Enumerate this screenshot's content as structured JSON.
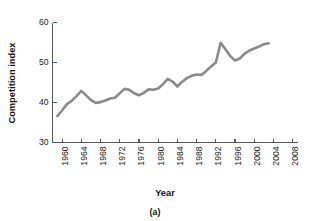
{
  "figure": {
    "caption": "(a)",
    "background": "#ffffff"
  },
  "chart_data": {
    "type": "line",
    "title": "",
    "xlabel": "Year",
    "ylabel": "Competition index",
    "xlim": [
      1958,
      2009
    ],
    "ylim": [
      30,
      60
    ],
    "xticks": [
      1960,
      1964,
      1968,
      1972,
      1976,
      1980,
      1984,
      1988,
      1992,
      1996,
      2000,
      2004,
      2008
    ],
    "yticks": [
      30,
      40,
      50,
      60
    ],
    "grid": false,
    "legend": null,
    "line_color": "#8a8a8a",
    "line_width": 2.6,
    "series": [
      {
        "name": "Competition index",
        "x": [
          1959,
          1960,
          1961,
          1962,
          1963,
          1964,
          1965,
          1966,
          1967,
          1968,
          1969,
          1970,
          1971,
          1972,
          1973,
          1974,
          1975,
          1976,
          1977,
          1978,
          1979,
          1980,
          1981,
          1982,
          1983,
          1984,
          1985,
          1986,
          1987,
          1988,
          1989,
          1990,
          1991,
          1992,
          1993,
          1994,
          1995,
          1996,
          1997,
          1998,
          1999,
          2000,
          2001,
          2002,
          2003
        ],
        "values": [
          36.6,
          38.0,
          39.6,
          40.4,
          41.6,
          42.9,
          41.8,
          40.6,
          39.9,
          40.1,
          40.5,
          41.0,
          41.2,
          42.3,
          43.4,
          43.2,
          42.3,
          41.8,
          42.4,
          43.3,
          43.2,
          43.5,
          44.6,
          45.9,
          45.2,
          44.0,
          45.2,
          46.1,
          46.7,
          47.0,
          46.9,
          47.9,
          49.0,
          50.0,
          54.9,
          53.3,
          51.6,
          50.5,
          51.0,
          52.2,
          53.0,
          53.5,
          54.0,
          54.6,
          54.8
        ]
      }
    ]
  },
  "axis_labels": {
    "ytick_texts": [
      "30",
      "40",
      "50",
      "60"
    ],
    "xtick_texts": [
      "1960",
      "1964",
      "1968",
      "1972",
      "1976",
      "1980",
      "1984",
      "1988",
      "1992",
      "1996",
      "2000",
      "2004",
      "2008"
    ]
  }
}
